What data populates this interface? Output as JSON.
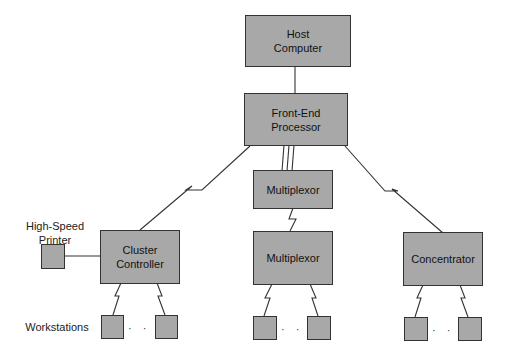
{
  "diagram": {
    "nodes": {
      "host": "Host\nComputer",
      "fep": "Front-End\nProcessor",
      "mux1": "Multiplexor",
      "mux2": "Multiplexor",
      "cluster": "Cluster\nController",
      "concentrator": "Concentrator"
    },
    "labels": {
      "printer": "High-Speed\nPrinter",
      "workstations": "Workstations",
      "ellipsis": "· · ·"
    },
    "colors": {
      "box_fill": "#a8a8a8",
      "line": "#333333"
    }
  }
}
